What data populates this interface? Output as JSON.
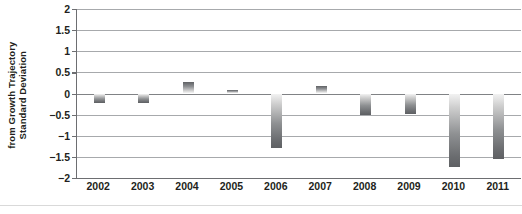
{
  "chart_data": {
    "type": "bar",
    "title": "",
    "xlabel": "",
    "ylabel": "Standard Deviation from Growth Trajectory",
    "ylabel_lines": [
      "Standard Deviation",
      "from Growth Trajectory"
    ],
    "categories": [
      "2002",
      "2003",
      "2004",
      "2005",
      "2006",
      "2007",
      "2008",
      "2009",
      "2010",
      "2011"
    ],
    "values": [
      -0.22,
      -0.23,
      0.27,
      0.08,
      -1.3,
      0.17,
      -0.5,
      -0.48,
      -1.75,
      -1.55
    ],
    "ylim": [
      -2,
      2
    ],
    "ytick_labels": [
      "2",
      "1.5",
      "1",
      "0.5",
      "0",
      "−0.5",
      "−1",
      "−1.5",
      "−2"
    ],
    "ytick_values": [
      2,
      1.5,
      1,
      0.5,
      0,
      -0.5,
      -1,
      -1.5,
      -2
    ],
    "grid": true,
    "legend": "none",
    "bar_color": "#8e9092",
    "gridline_color": "#a7a9ac",
    "axis_color": "#6d6e71",
    "text_color": "#231f20"
  }
}
